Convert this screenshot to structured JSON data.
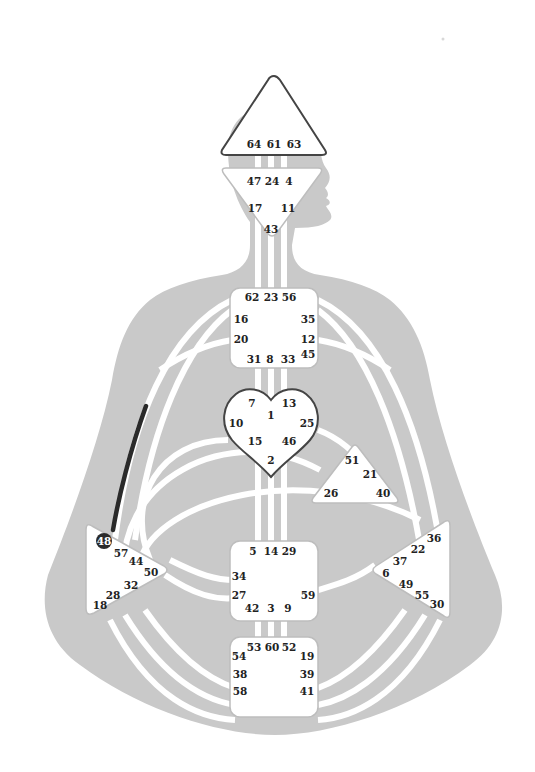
{
  "diagram": {
    "type": "human-design-bodygraph",
    "colors": {
      "background": "#ffffff",
      "silhouette": "#c9c9c9",
      "channel": "#ffffff",
      "active_channel": "#2a2a2a",
      "center_fill": "#ffffff",
      "text": "#222222"
    },
    "centers": {
      "head": {
        "gates": [
          "64",
          "61",
          "63"
        ]
      },
      "ajna": {
        "gates": [
          "47",
          "24",
          "4",
          "17",
          "11",
          "43"
        ]
      },
      "throat": {
        "gates": [
          "62",
          "23",
          "56",
          "16",
          "35",
          "20",
          "12",
          "45",
          "31",
          "8",
          "33"
        ]
      },
      "g": {
        "gates": [
          "7",
          "1",
          "13",
          "10",
          "25",
          "15",
          "46",
          "2"
        ]
      },
      "ego": {
        "gates": [
          "51",
          "21",
          "26",
          "40"
        ]
      },
      "spleen": {
        "gates": [
          "48",
          "57",
          "44",
          "50",
          "32",
          "28",
          "18"
        ]
      },
      "solar_plexus": {
        "gates": [
          "36",
          "22",
          "37",
          "6",
          "49",
          "55",
          "30"
        ]
      },
      "sacral": {
        "gates": [
          "5",
          "14",
          "29",
          "34",
          "27",
          "59",
          "42",
          "3",
          "9"
        ]
      },
      "root": {
        "gates": [
          "53",
          "60",
          "52",
          "54",
          "19",
          "38",
          "39",
          "58",
          "41"
        ]
      }
    },
    "highlighted_gate": "48",
    "active_channel_label": "48 (Spleen) upward line"
  }
}
